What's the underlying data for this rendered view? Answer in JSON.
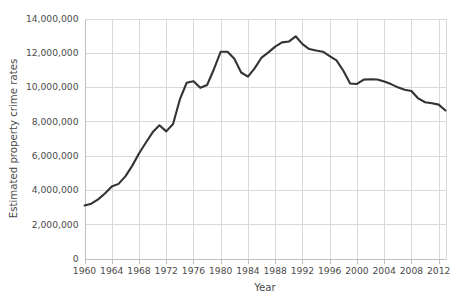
{
  "chart_data": {
    "type": "line",
    "title": "",
    "subtitle": "",
    "xlabel": "Year",
    "ylabel": "Estimated property crime rates",
    "xlim": [
      1960,
      2013
    ],
    "ylim": [
      0,
      14000000
    ],
    "grid": true,
    "legend": false,
    "legend_position": "none",
    "y_ticks": [
      0,
      2000000,
      4000000,
      6000000,
      8000000,
      10000000,
      12000000,
      14000000
    ],
    "y_tick_labels": [
      "0",
      "2,000,000",
      "4,000,000",
      "6,000,000",
      "8,000,000",
      "10,000,000",
      "12,000,000",
      "14,000,000"
    ],
    "x_ticks": [
      1960,
      1964,
      1968,
      1972,
      1976,
      1980,
      1984,
      1988,
      1992,
      1996,
      2000,
      2004,
      2008,
      2012
    ],
    "x_tick_labels": [
      "1960",
      "1964",
      "1968",
      "1972",
      "1976",
      "1980",
      "1984",
      "1988",
      "1992",
      "1996",
      "2000",
      "2004",
      "2008",
      "2012"
    ],
    "series": [
      {
        "name": "Estimated property crime rates",
        "color": "#333333",
        "x": [
          1960,
          1961,
          1962,
          1963,
          1964,
          1965,
          1966,
          1967,
          1968,
          1969,
          1970,
          1971,
          1972,
          1973,
          1974,
          1975,
          1976,
          1977,
          1978,
          1979,
          1980,
          1981,
          1982,
          1983,
          1984,
          1985,
          1986,
          1987,
          1988,
          1989,
          1990,
          1991,
          1992,
          1993,
          1994,
          1995,
          1996,
          1997,
          1998,
          1999,
          2000,
          2001,
          2002,
          2003,
          2004,
          2005,
          2006,
          2007,
          2008,
          2009,
          2010,
          2011,
          2012,
          2013
        ],
        "values": [
          3095700,
          3198600,
          3450700,
          3792500,
          4200400,
          4352000,
          4793300,
          5403500,
          6125200,
          6749000,
          7359200,
          7771700,
          7413900,
          7842200,
          9278700,
          10252700,
          10345500,
          9955000,
          10123400,
          11041500,
          12063700,
          12061900,
          11652000,
          10850500,
          10608500,
          11102600,
          11722700,
          12024700,
          12356900,
          12605400,
          12655500,
          12961100,
          12505900,
          12218800,
          12131900,
          12063900,
          11805300,
          11558475,
          10951827,
          10208334,
          10182584,
          10437189,
          10455277,
          10442862,
          10319386,
          10174754,
          9983568,
          9843481,
          9774152,
          9337060,
          9112625,
          9052743,
          8975438,
          8632512
        ]
      }
    ]
  },
  "axis": {
    "y_title": "Estimated property crime rates",
    "x_title": "Year"
  }
}
